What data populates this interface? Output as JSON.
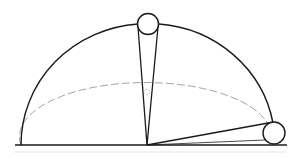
{
  "diagram": {
    "colors": {
      "stroke": "#1a1a1a",
      "dashed": "#999999",
      "background": "#ffffff"
    },
    "baseline": {
      "x1": 15,
      "y1": 145,
      "x2": 287,
      "y2": 145
    },
    "arc": {
      "cx": 147,
      "cy": 145,
      "rx": 126,
      "ry": 121
    },
    "dashed_ellipse": {
      "cx": 147,
      "cy": 145,
      "rx": 126,
      "ry": 54
    },
    "pivot": {
      "x": 147,
      "y": 145
    },
    "balls": [
      {
        "name": "top-ball",
        "cx": 148,
        "cy": 24,
        "r": 10.5
      },
      {
        "name": "right-ball",
        "cx": 274,
        "cy": 133,
        "r": 11
      }
    ]
  }
}
